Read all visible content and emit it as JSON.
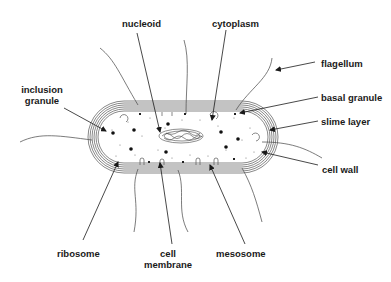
{
  "diagram": {
    "labels": {
      "nucleoid": "nucleoid",
      "cytoplasm": "cytoplasm",
      "flagellum": "flagellum",
      "inclusion_granule_line1": "inclusion",
      "inclusion_granule_line2": "granule",
      "basal_granule": "basal granule",
      "slime_layer": "slime layer",
      "cell_wall": "cell wall",
      "ribosome": "ribosome",
      "cell_membrane_line1": "cell",
      "cell_membrane_line2": "membrane",
      "mesosome": "mesosome"
    },
    "colors": {
      "ink": "#1a1a1a",
      "line": "#333333",
      "background": "#ffffff"
    }
  }
}
